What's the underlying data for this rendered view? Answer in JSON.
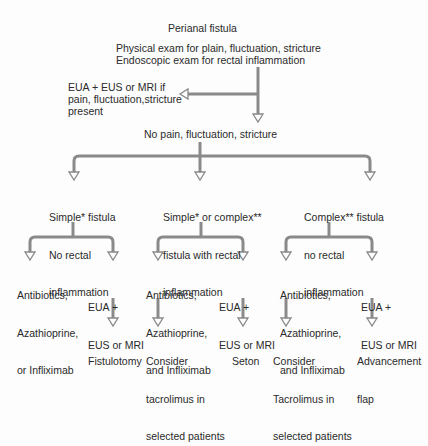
{
  "diagram": {
    "root": {
      "title": "Perianal fistula",
      "exam_line1": "Physical exam for plain, fluctuation, stricture",
      "exam_line2": "Endoscopic exam for rectal inflammation"
    },
    "side_branch": {
      "line1": "EUA + EUS or MRI if",
      "line2": "pain, fluctuation,stricture",
      "line3": "present"
    },
    "no_pain": "No pain, fluctuation, stricture",
    "branches": [
      {
        "label_lines": [
          "Simple* fistula",
          "No rectal",
          "inflammation"
        ],
        "options": [
          {
            "lines": [
              "Antibiotics,",
              "Azathioprine,",
              "or Infliximab"
            ],
            "outcome": []
          },
          {
            "lines": [
              "EUA +",
              "EUS or MRI"
            ],
            "outcome": [
              "Fistulotomy"
            ]
          }
        ]
      },
      {
        "label_lines": [
          "Simple* or complex**",
          "fistula with rectal",
          "inflammation"
        ],
        "options": [
          {
            "lines": [
              "Antibiotics,",
              "Azathioprine,",
              "and Infliximab"
            ],
            "outcome": [
              "Consider",
              "tacrolimus in",
              "selected patients"
            ]
          },
          {
            "lines": [
              "EUA +",
              "EUS or MRI"
            ],
            "outcome": [
              "Seton"
            ]
          }
        ]
      },
      {
        "label_lines": [
          "Complex** fistula",
          "no rectal",
          "inflammation"
        ],
        "options": [
          {
            "lines": [
              "Antibiotics,",
              "Azathioprine,",
              "and Infliximab"
            ],
            "outcome": [
              "Consider",
              "Tacrolimus in",
              "selected patients"
            ]
          },
          {
            "lines": [
              "EUA +",
              "EUS or MRI"
            ],
            "outcome": [
              "Advancement",
              "flap"
            ]
          }
        ]
      }
    ],
    "colors": {
      "arrow": "#8a8a8a",
      "text": "#2a2a2a",
      "background": "#fdfdfd"
    }
  }
}
